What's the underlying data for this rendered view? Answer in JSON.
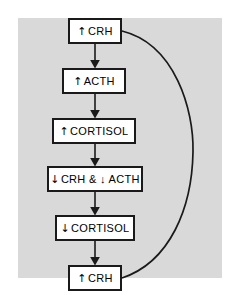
{
  "figure": {
    "panel_color": "#d9d9d9",
    "background_color": "#ffffff",
    "line_color": "#1a1a1a",
    "box_fill": "#ffffff"
  },
  "nodes": [
    {
      "id": "node-crh-up-top",
      "direction_icon": "up-arrow-icon",
      "direction": "↑",
      "label": "CRH",
      "text": "↑ CRH",
      "x": 68,
      "y": 18,
      "width": 54,
      "height": 26
    },
    {
      "id": "node-acth-up",
      "direction_icon": "up-arrow-icon",
      "direction": "↑",
      "label": "ACTH",
      "text": "↑ ACTH",
      "x": 62,
      "y": 68,
      "width": 64,
      "height": 26
    },
    {
      "id": "node-cortisol-up",
      "direction_icon": "up-arrow-icon",
      "direction": "↑",
      "label": "CORTISOL",
      "text": "↑ CORTISOL",
      "x": 52,
      "y": 118,
      "width": 84,
      "height": 26
    },
    {
      "id": "node-crh-acth-down",
      "direction_icon": "down-arrow-icon",
      "direction": "↓",
      "label": "CRH & ↓ ACTH",
      "text": "↓ CRH & ↓ ACTH",
      "x": 47,
      "y": 166,
      "width": 96,
      "height": 26
    },
    {
      "id": "node-cortisol-down",
      "direction_icon": "down-arrow-icon",
      "direction": "↓",
      "label": "CORTISOL",
      "text": "↓ CORTISOL",
      "x": 55,
      "y": 215,
      "width": 80,
      "height": 26
    },
    {
      "id": "node-crh-up-bottom",
      "direction_icon": "up-arrow-icon",
      "direction": "↑",
      "label": "CRH",
      "text": "↑ CRH",
      "x": 68,
      "y": 265,
      "width": 54,
      "height": 26
    }
  ],
  "connectors": [
    {
      "id": "connector-1",
      "from": "node-crh-up-top",
      "to": "node-acth-up",
      "type": "straight-arrow-down"
    },
    {
      "id": "connector-2",
      "from": "node-acth-up",
      "to": "node-cortisol-up",
      "type": "straight-arrow-down"
    },
    {
      "id": "connector-3",
      "from": "node-cortisol-up",
      "to": "node-crh-acth-down",
      "type": "straight-arrow-down"
    },
    {
      "id": "connector-4",
      "from": "node-crh-acth-down",
      "to": "node-cortisol-down",
      "type": "straight-arrow-down"
    },
    {
      "id": "connector-5",
      "from": "node-cortisol-down",
      "to": "node-crh-up-bottom",
      "type": "straight-arrow-down"
    },
    {
      "id": "connector-feedback",
      "from": "node-crh-up-bottom",
      "to": "node-crh-up-top",
      "type": "curved-loop-right"
    }
  ]
}
